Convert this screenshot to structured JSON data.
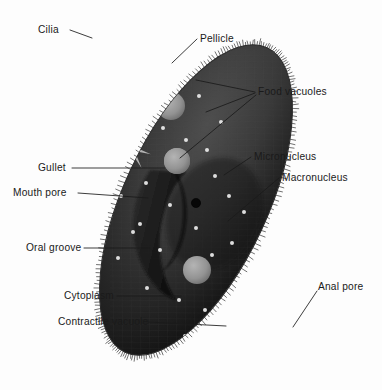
{
  "diagram": {
    "background_color": "#fdfdfd",
    "body": {
      "name": "paramecium-body",
      "fill_color": "#3a3a3a",
      "fill_color_dark": "#141414",
      "outline_color": "#2a2a2a",
      "rotation_degrees": 25,
      "center_x": 196,
      "center_y": 200,
      "radius_x": 72,
      "radius_y": 168
    },
    "colors": {
      "cell_light": "#4a4a4a",
      "cell_mid": "#333333",
      "cell_dark": "#101010",
      "vacuole": "#9a9a9a",
      "vacuole_light": "#b0b0b0",
      "trichocyst": "#e8e8e8",
      "star": "#c8c8c8",
      "macronucleus": "#080808",
      "leader_line": "#1a1a1a",
      "text": "#1a1a1a"
    },
    "labels": [
      {
        "id": "cilia",
        "text": "Cilia",
        "text_x": 38,
        "text_y": 33,
        "anchor": "start",
        "leader": "M 70 30 L 92 38",
        "side": "left"
      },
      {
        "id": "pellicle",
        "text": "Pellicle",
        "text_x": 200,
        "text_y": 42,
        "anchor": "start",
        "leader": "M 197 39 L 172 63",
        "side": "right"
      },
      {
        "id": "food-vacuoles",
        "text": "Food vacuoles",
        "text_x": 258,
        "text_y": 95,
        "anchor": "start",
        "leader": "M 255 92 L 196 80 M 255 93 L 206 112 M 256 95 L 180 158",
        "side": "right"
      },
      {
        "id": "micronucleus",
        "text": "Micronucleus",
        "text_x": 254,
        "text_y": 160,
        "anchor": "start",
        "leader": "M 251 157 L 224 175",
        "side": "right"
      },
      {
        "id": "macronucleus",
        "text": "Macronucleus",
        "text_x": 282,
        "text_y": 181,
        "anchor": "start",
        "leader": "M 279 178 L 228 221",
        "side": "right"
      },
      {
        "id": "gullet",
        "text": "Gullet",
        "text_x": 38,
        "text_y": 171,
        "anchor": "start",
        "leader": "M 72 168 L 165 168",
        "side": "left"
      },
      {
        "id": "mouth-pore",
        "text": "Mouth pore",
        "text_x": 13,
        "text_y": 196,
        "anchor": "start",
        "leader": "M 78 193 L 148 198",
        "side": "left"
      },
      {
        "id": "oral-groove",
        "text": "Oral groove",
        "text_x": 26,
        "text_y": 251,
        "anchor": "start",
        "leader": "M 84 248 L 150 248",
        "side": "left"
      },
      {
        "id": "cytoplasm",
        "text": "Cytoplasm",
        "text_x": 64,
        "text_y": 299,
        "anchor": "start",
        "leader": "M 117 296 L 181 296",
        "side": "left"
      },
      {
        "id": "contractile-vacuole",
        "text": "Contractile vacuole",
        "text_x": 58,
        "text_y": 325,
        "anchor": "start",
        "leader": "M 148 322 L 226 326",
        "side": "left"
      },
      {
        "id": "anal-pore",
        "text": "Anal pore",
        "text_x": 318,
        "text_y": 290,
        "anchor": "start",
        "leader": "M 317 291 L 293 327",
        "side": "right"
      }
    ],
    "food_vacuoles": [
      {
        "id": "fv-1",
        "cx": 139,
        "cy": 74,
        "rx": 17,
        "ry": 17,
        "shade": "#8e8e8e"
      },
      {
        "id": "fv-2",
        "cx": 110,
        "cy": 101,
        "rx": 12,
        "ry": 12,
        "shade": "#8a8a8a"
      },
      {
        "id": "fv-3",
        "cx": 171,
        "cy": 106,
        "rx": 14,
        "ry": 14,
        "shade": "#949494"
      },
      {
        "id": "fv-4",
        "cx": 177,
        "cy": 161,
        "rx": 13,
        "ry": 13,
        "shade": "#8d8d8d"
      },
      {
        "id": "fv-5",
        "cx": 197,
        "cy": 270,
        "rx": 14,
        "ry": 14,
        "shade": "#8c8c8c"
      },
      {
        "id": "fv-6",
        "cx": 256,
        "cy": 284,
        "rx": 14,
        "ry": 16,
        "shade": "#909090"
      }
    ],
    "micronucleus": {
      "id": "micronucleus-blob",
      "cx": 177,
      "cy": 161,
      "r": 13
    },
    "macronucleus": {
      "id": "macronucleus-dot",
      "cx": 196,
      "cy": 203,
      "r": 4.6
    },
    "contractile_vacuoles": [
      {
        "id": "cv-upper",
        "cx": 131,
        "cy": 148,
        "radius": 20,
        "spokes": 8
      },
      {
        "id": "cv-lower",
        "cx": 241,
        "cy": 322,
        "radius": 24,
        "spokes": 9
      }
    ],
    "anal_pore": {
      "id": "anal-pore-vacuole",
      "cx": 277,
      "cy": 330,
      "rx": 10,
      "ry": 11
    },
    "trichocysts": [
      [
        121,
        46
      ],
      [
        156,
        56
      ],
      [
        100,
        70
      ],
      [
        173,
        82
      ],
      [
        92,
        95
      ],
      [
        148,
        92
      ],
      [
        129,
        120
      ],
      [
        163,
        128
      ],
      [
        103,
        131
      ],
      [
        186,
        140
      ],
      [
        112,
        162
      ],
      [
        207,
        150
      ],
      [
        146,
        183
      ],
      [
        121,
        196
      ],
      [
        215,
        176
      ],
      [
        170,
        205
      ],
      [
        229,
        196
      ],
      [
        140,
        224
      ],
      [
        196,
        228
      ],
      [
        244,
        212
      ],
      [
        160,
        250
      ],
      [
        232,
        243
      ],
      [
        118,
        258
      ],
      [
        179,
        300
      ],
      [
        212,
        255
      ],
      [
        253,
        257
      ],
      [
        147,
        288
      ],
      [
        266,
        300
      ],
      [
        205,
        310
      ],
      [
        185,
        336
      ],
      [
        238,
        355
      ],
      [
        260,
        338
      ],
      [
        133,
        232
      ],
      [
        221,
        122
      ],
      [
        199,
        96
      ]
    ],
    "label_count": 11
  }
}
